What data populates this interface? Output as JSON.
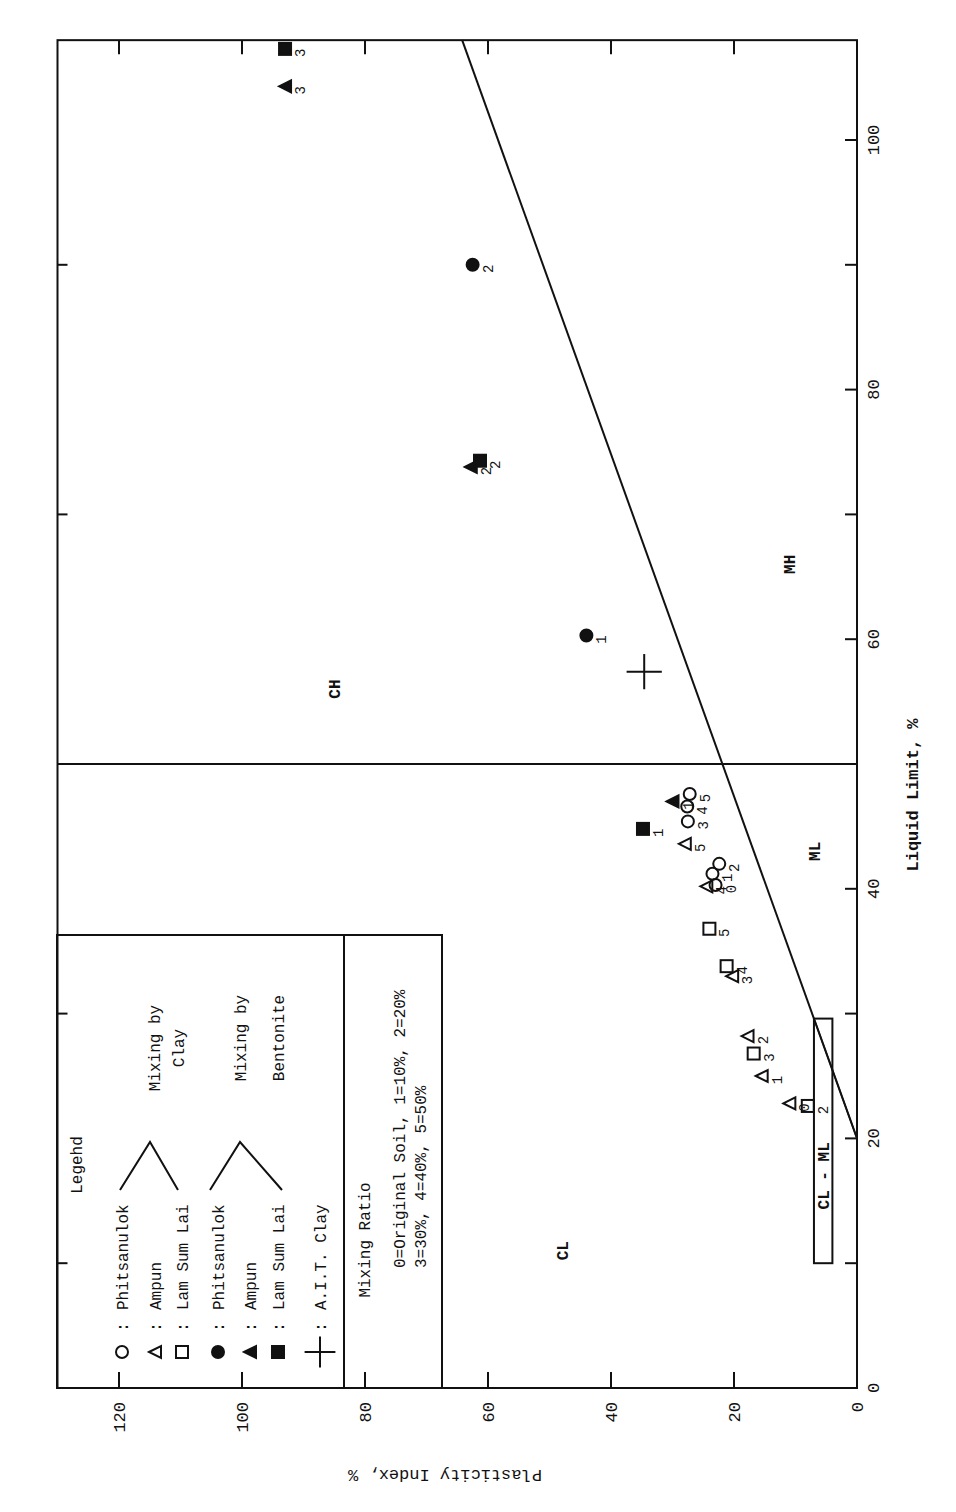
{
  "chart_data": {
    "type": "scatter",
    "title": "",
    "orientation": "rotated-90-ccw",
    "xlabel": "Liquid Limit, %",
    "ylabel": "Plasticity Index, %",
    "xlim": [
      0,
      108
    ],
    "ylim": [
      0,
      130
    ],
    "xticks": [
      0,
      20,
      40,
      60,
      80,
      100
    ],
    "xminor_ticks": [
      10,
      30,
      50,
      70,
      90
    ],
    "yticks": [
      0,
      20,
      40,
      60,
      80,
      100,
      120
    ],
    "grid": false,
    "a_line": {
      "name": "A-line",
      "points": [
        [
          20,
          0
        ],
        [
          108,
          64.2
        ]
      ]
    },
    "u_line_segment": {
      "points": [
        [
          20,
          0
        ],
        [
          29.6,
          7
        ]
      ]
    },
    "ll50_line": {
      "x": 50,
      "ymin": 0,
      "ymax": 130
    },
    "zones": [
      {
        "label": "CH",
        "x": 56,
        "y": 85
      },
      {
        "label": "MH",
        "x": 66,
        "y": 11
      },
      {
        "label": "ML",
        "x": 43,
        "y": 7
      },
      {
        "label": "CL",
        "x": 11,
        "y": 48
      },
      {
        "label": "CL - ML",
        "x": 17,
        "y": 5.5,
        "box": {
          "x0": 10,
          "x1": 29.6,
          "y0": 4,
          "y1": 7
        }
      }
    ],
    "series": [
      {
        "name": "Phitsanulok (Mixing by Clay)",
        "marker": "circle-open",
        "points": [
          {
            "label": "0",
            "x": 40.3,
            "y": 23.0
          },
          {
            "label": "1",
            "x": 41.2,
            "y": 23.5
          },
          {
            "label": "2",
            "x": 42.0,
            "y": 22.4
          },
          {
            "label": "3",
            "x": 45.4,
            "y": 27.5
          },
          {
            "label": "4",
            "x": 46.6,
            "y": 27.6
          },
          {
            "label": "5",
            "x": 47.6,
            "y": 27.2
          }
        ]
      },
      {
        "name": "Ampun (Mixing by Clay)",
        "marker": "triangle-open",
        "points": [
          {
            "label": "0",
            "x": 22.8,
            "y": 11.0
          },
          {
            "label": "1",
            "x": 25.0,
            "y": 15.5
          },
          {
            "label": "2",
            "x": 28.2,
            "y": 17.8
          },
          {
            "label": "3",
            "x": 33.0,
            "y": 20.3
          },
          {
            "label": "4",
            "x": 40.2,
            "y": 24.5
          },
          {
            "label": "5",
            "x": 43.6,
            "y": 28.0
          }
        ]
      },
      {
        "name": "Lam Sum Lai (Mixing by Clay)",
        "marker": "square-open",
        "points": [
          {
            "label": "2",
            "x": 22.6,
            "y": 8.0
          },
          {
            "label": "3",
            "x": 26.8,
            "y": 16.8
          },
          {
            "label": "4",
            "x": 33.8,
            "y": 21.2
          },
          {
            "label": "5",
            "x": 36.8,
            "y": 24.0
          }
        ]
      },
      {
        "name": "Phitsanulok (Mixing by Bentonite)",
        "marker": "circle-filled",
        "points": [
          {
            "label": "1",
            "x": 60.3,
            "y": 44.0
          },
          {
            "label": "2",
            "x": 90.0,
            "y": 62.5
          }
        ]
      },
      {
        "name": "Ampun (Mixing by Bentonite)",
        "marker": "triangle-filled",
        "points": [
          {
            "label": "1",
            "x": 47.0,
            "y": 30.0
          },
          {
            "label": "2",
            "x": 73.8,
            "y": 62.8
          },
          {
            "label": "3",
            "x": 104.3,
            "y": 93.0
          }
        ]
      },
      {
        "name": "Lam Sum Lai (Mixing by Bentonite)",
        "marker": "square-filled",
        "points": [
          {
            "label": "1",
            "x": 44.8,
            "y": 34.8
          },
          {
            "label": "2",
            "x": 74.3,
            "y": 61.3
          },
          {
            "label": "3",
            "x": 107.3,
            "y": 93.0
          }
        ]
      },
      {
        "name": "A.I.T. Clay",
        "marker": "plus",
        "points": [
          {
            "label": "",
            "x": 57.4,
            "y": 34.6
          }
        ]
      }
    ],
    "legend": {
      "title": "Legehd",
      "entries": [
        {
          "marker": "circle-open",
          "label": "Phitsanulok"
        },
        {
          "marker": "triangle-open",
          "label": "Ampun"
        },
        {
          "marker": "square-open",
          "label": "Lam Sum Lai"
        },
        {
          "marker": "circle-filled",
          "label": "Phitsanulok"
        },
        {
          "marker": "triangle-filled",
          "label": "Ampun"
        },
        {
          "marker": "square-filled",
          "label": "Lam Sum Lai"
        },
        {
          "marker": "plus",
          "label": "A.I.T. Clay"
        }
      ],
      "groups": [
        {
          "label_line1": "Mixing by",
          "label_line2": "Clay"
        },
        {
          "label_line1": "Mixing by",
          "label_line2": "Bentonite"
        }
      ],
      "mixing_ratio": {
        "title": "Mixing Ratio",
        "line1": "0=Original Soil, 1=10%, 2=20%",
        "line2": "3=30%, 4=40%, 5=50%"
      }
    }
  },
  "colors": {
    "ink": "#111111",
    "paper": "#ffffff"
  }
}
